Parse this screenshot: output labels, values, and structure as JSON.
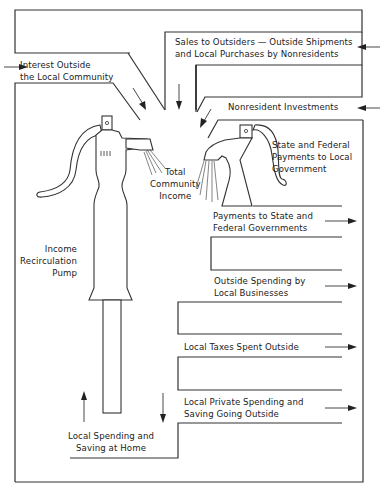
{
  "diagram": {
    "type": "flow-diagram",
    "inflows": [
      {
        "id": "interest",
        "label": "Interest Outside\nthe Local Community",
        "direction": "in"
      },
      {
        "id": "sales",
        "label": "Sales to Outsiders — Outside Shipments\nand Local Purchases by Nonresidents",
        "direction": "in"
      },
      {
        "id": "nonresident",
        "label": "Nonresident Investments",
        "direction": "in"
      },
      {
        "id": "state_federal_in",
        "label": "State and Federal\nPayments to Local\nGovernment",
        "direction": "in"
      }
    ],
    "center": {
      "total_income": "Total\nCommunity\nIncome",
      "pump": "Income\nRecirculation\nPump",
      "home": "Local Spending and\nSaving at Home"
    },
    "outflows": [
      {
        "id": "payments_state",
        "label": "Payments to State and\nFederal Governments",
        "direction": "out"
      },
      {
        "id": "outside_business",
        "label": "Outside Spending by\nLocal Businesses",
        "direction": "out"
      },
      {
        "id": "taxes_outside",
        "label": "Local Taxes Spent Outside",
        "direction": "out"
      },
      {
        "id": "private_outside",
        "label": "Local Private Spending and\nSaving Going Outside",
        "direction": "out"
      }
    ],
    "colors": {
      "ink": "#333333",
      "background": "#ffffff"
    }
  }
}
